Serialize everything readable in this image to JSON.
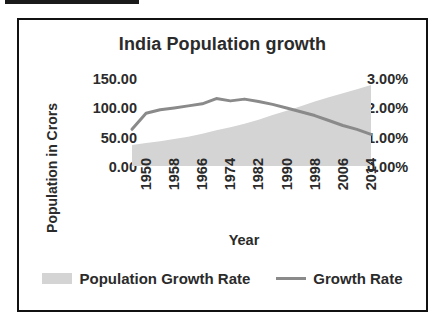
{
  "figure": {
    "title": "India Population growth",
    "top_bar_present": true,
    "frame_border_color": "#111111",
    "background": "#ffffff"
  },
  "axes": {
    "x_title": "Year",
    "y_left_title": "Population in Crors",
    "y_left_ticks": [
      "150.00",
      "100.00",
      "50.00",
      "0.00"
    ],
    "y_right_ticks": [
      "3.00%",
      "2.00%",
      "1.00%",
      "0.00%"
    ],
    "x_ticks": [
      "1950",
      "1958",
      "1966",
      "1974",
      "1982",
      "1990",
      "1998",
      "2006",
      "2014"
    ]
  },
  "legend": {
    "items": [
      {
        "label": "Population Growth Rate",
        "marker": "area-swatch",
        "color": "#d4d4d4"
      },
      {
        "label": "Growth Rate",
        "marker": "line-swatch",
        "color": "#8a8a8a"
      }
    ]
  },
  "chart_data": {
    "type": "area",
    "title": "India Population growth",
    "xlabel": "Year",
    "ylabel": "Population in Crors",
    "y2label": "Growth Rate",
    "grid": false,
    "legend_position": "bottom",
    "ylim": [
      0,
      150
    ],
    "y2lim": [
      0,
      3
    ],
    "xlim": [
      1950,
      2018
    ],
    "x_tick_step": 8,
    "x": [
      1950,
      1954,
      1958,
      1962,
      1966,
      1970,
      1974,
      1978,
      1982,
      1986,
      1990,
      1994,
      1998,
      2002,
      2006,
      2010,
      2014,
      2018
    ],
    "series": [
      {
        "name": "Population Growth Rate",
        "axis": "left",
        "unit": "Crors",
        "render": "area",
        "color": "#d4d4d4",
        "values": [
          36,
          39,
          42,
          46,
          50,
          55,
          61,
          66,
          72,
          79,
          87,
          94,
          102,
          110,
          117,
          124,
          131,
          138
        ]
      },
      {
        "name": "Growth Rate",
        "axis": "right",
        "unit": "%",
        "render": "line",
        "color": "#8a8a8a",
        "values": [
          1.25,
          1.8,
          1.92,
          1.98,
          2.05,
          2.12,
          2.3,
          2.22,
          2.28,
          2.2,
          2.1,
          1.98,
          1.85,
          1.72,
          1.55,
          1.38,
          1.25,
          1.08
        ]
      }
    ]
  }
}
